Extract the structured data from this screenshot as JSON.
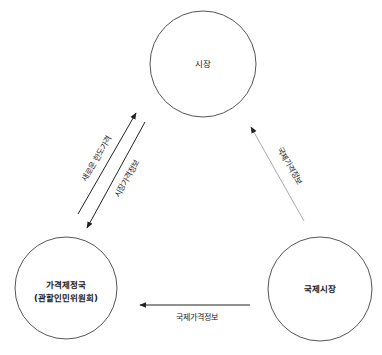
{
  "diagram": {
    "nodes": [
      {
        "id": "market",
        "label_lines": [
          "시장"
        ],
        "cx": 203,
        "cy": 64,
        "r": 53,
        "stroke": "#555555"
      },
      {
        "id": "price_bureau",
        "label_lines": [
          "가격제정국",
          "(관할인민위원회)"
        ],
        "cx": 66,
        "cy": 288,
        "r": 51,
        "stroke": "#555555"
      },
      {
        "id": "intl_market",
        "label_lines": [
          "국제시장"
        ],
        "cx": 320,
        "cy": 289,
        "r": 52,
        "stroke": "#555555"
      }
    ],
    "edges": [
      {
        "id": "new-limit-price",
        "from": "price_bureau",
        "to": "market",
        "label": "새로운 한도가격",
        "x1": 78,
        "y1": 214,
        "x2": 136,
        "y2": 113,
        "color": "#222222"
      },
      {
        "id": "market-price-info",
        "from": "market",
        "to": "price_bureau",
        "label": "시장가격정보",
        "x1": 145,
        "y1": 122,
        "x2": 87,
        "y2": 228,
        "color": "#222222"
      },
      {
        "id": "intl-price-info-to-market",
        "from": "intl_market",
        "to": "market",
        "label": "국제가격정보",
        "x1": 304,
        "y1": 221,
        "x2": 251,
        "y2": 127,
        "color": "#aaaaaa"
      },
      {
        "id": "intl-price-info-to-bureau",
        "from": "intl_market",
        "to": "price_bureau",
        "label": "국제가격정보",
        "x1": 250,
        "y1": 305,
        "x2": 140,
        "y2": 305,
        "color": "#222222"
      }
    ]
  }
}
